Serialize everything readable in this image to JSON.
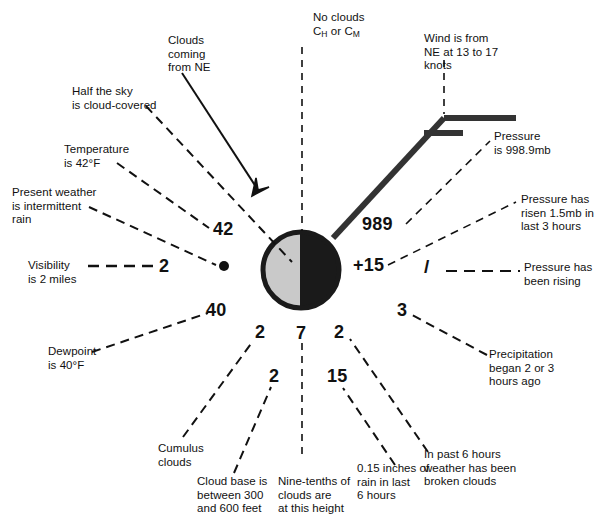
{
  "diagram": {
    "type": "weather-station-model",
    "canvas": {
      "width": 605,
      "height": 530,
      "background": "#ffffff"
    },
    "colors": {
      "ink": "#111111",
      "sky_cover_shaded": "#111111",
      "sky_cover_clear": "#c9c9c9",
      "circle_outline": "#111111"
    },
    "station_circle": {
      "name": "sky-cover-symbol",
      "center_x": 301,
      "center_y": 270,
      "radius": 38,
      "description": "Half-filled circle: left half light gray, right half black"
    },
    "wind_barb": {
      "name": "wind-barb",
      "description": "Shaft to the NE with one full barb and one half barb",
      "full_barbs": 1,
      "half_barbs": 0.5,
      "speed_text": "13 to 17 knots",
      "direction_text": "NE"
    },
    "plotted_values": {
      "temperature": "42",
      "visibility": "2",
      "present_weather": "•",
      "pressure": "989",
      "pressure_change": "+15",
      "pressure_tendency": "/",
      "dewpoint": "40",
      "low_cloud_type": "2",
      "cloud_base_height": "2",
      "sky_cover_amount": "7",
      "mid_cloud_amount": "2",
      "precip_began": "3",
      "precip_amount": "15",
      "past_weather": "2"
    },
    "callouts": [
      {
        "id": "no-clouds",
        "text": "No clouds\nC_H or C_M"
      },
      {
        "id": "clouds-from-ne",
        "text": "Clouds\ncoming\nfrom NE"
      },
      {
        "id": "half-sky-covered",
        "text": "Half the sky\nis cloud-covered"
      },
      {
        "id": "temperature",
        "text": "Temperature\nis 42°F"
      },
      {
        "id": "present-weather",
        "text": "Present weather\nis intermittent\nrain"
      },
      {
        "id": "visibility",
        "text": "Visibility\nis 2 miles"
      },
      {
        "id": "wind",
        "text": "Wind is from\nNE at 13 to 17\nknots"
      },
      {
        "id": "pressure",
        "text": "Pressure\nis 998.9mb"
      },
      {
        "id": "pressure-risen",
        "text": "Pressure has\nrisen 1.5mb in\nlast 3 hours"
      },
      {
        "id": "pressure-rising",
        "text": "Pressure has\nbeen rising"
      },
      {
        "id": "dewpoint",
        "text": "Dewpoint\nis 40°F"
      },
      {
        "id": "cumulus",
        "text": "Cumulus\nclouds"
      },
      {
        "id": "cloud-base",
        "text": "Cloud base is\nbetween 300\nand 600 feet"
      },
      {
        "id": "nine-tenths",
        "text": "Nine-tenths of\nclouds are\nat this height"
      },
      {
        "id": "rain-amount",
        "text": "0.15 inches of\nrain in last\n6 hours"
      },
      {
        "id": "past-weather",
        "text": "In past 6 hours\nweather has been\nbroken clouds"
      },
      {
        "id": "precip-began",
        "text": "Precipitation\nbegan 2 or 3\nhours ago"
      }
    ],
    "labels": {
      "no_clouds_line1": "No clouds",
      "no_clouds_c": "C",
      "no_clouds_sub_h": "H",
      "no_clouds_or": " or C",
      "no_clouds_sub_m": "M",
      "clouds_from_ne": "Clouds\ncoming\nfrom NE",
      "half_sky": "Half the sky\nis cloud-covered",
      "temperature": "Temperature\nis 42°F",
      "present_weather": "Present weather\nis intermittent\nrain",
      "visibility": "Visibility\nis 2 miles",
      "wind": "Wind is from\nNE at 13 to 17\nknots",
      "pressure": "Pressure\nis 998.9mb",
      "pressure_risen": "Pressure has\nrisen 1.5mb in\nlast 3 hours",
      "pressure_rising": "Pressure has\nbeen rising",
      "dewpoint": "Dewpoint\nis 40°F",
      "cumulus": "Cumulus\nclouds",
      "cloud_base": "Cloud base is\nbetween 300\nand 600 feet",
      "nine_tenths": "Nine-tenths of\nclouds are\nat this height",
      "rain_amount": "0.15 inches of\nrain in last\n6 hours",
      "past_weather": "In past 6 hours\nweather has been\nbroken clouds",
      "precip_began": "Precipitation\nbegan 2 or 3\nhours ago"
    },
    "numbers": {
      "temperature": "42",
      "visibility": "2",
      "pressure": "989",
      "pressure_change": "+15",
      "pressure_tendency": "/",
      "dewpoint": "40",
      "low_cloud": "2",
      "cloud_base": "2",
      "sky_height": "7",
      "mid_cloud": "2",
      "precip_began": "3",
      "precip_amount": "15"
    }
  }
}
